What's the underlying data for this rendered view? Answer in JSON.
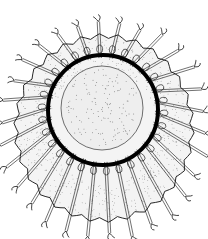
{
  "figure": {
    "colors": {
      "background": "#ffffff",
      "ink": "#111111",
      "ring": "#000000",
      "stipple": "#555555",
      "bell_fill": "#f4f4f4",
      "center_fill": "#eeeeee"
    },
    "geometry": {
      "bell": {
        "cx": 104,
        "cy": 128,
        "rx": 88,
        "ry": 92
      },
      "ring": {
        "cx": 103,
        "cy": 110,
        "r": 55,
        "stroke": 4
      },
      "center": {
        "cx": 102,
        "cy": 108,
        "rx": 41,
        "ry": 42
      },
      "tentacle_count": 30
    }
  }
}
